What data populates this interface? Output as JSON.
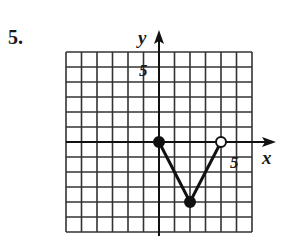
{
  "problem": {
    "number": "5."
  },
  "chart_data": {
    "type": "line",
    "title": "",
    "xlabel": "x",
    "ylabel": "y",
    "xlim": [
      -6,
      6
    ],
    "ylim": [
      -6,
      6
    ],
    "grid": true,
    "tick_labels": {
      "x": [
        "5"
      ],
      "y": [
        "5"
      ]
    },
    "series": [
      {
        "name": "piecewise",
        "points": [
          {
            "x": 0,
            "y": 0,
            "marker": "closed"
          },
          {
            "x": 2,
            "y": -4,
            "marker": "closed"
          },
          {
            "x": 4,
            "y": 0,
            "marker": "open"
          }
        ]
      }
    ]
  },
  "labels": {
    "x_axis": "x",
    "y_axis": "y",
    "x_tick": "5",
    "y_tick": "5"
  }
}
